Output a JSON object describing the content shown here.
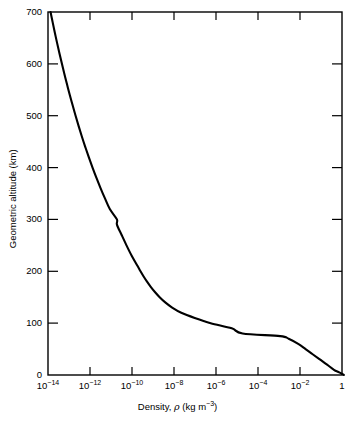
{
  "chart_data": {
    "type": "line",
    "title": "",
    "xlabel": "Density, ρ (kg m⁻³)",
    "ylabel": "Geometric altitude (km)",
    "xscale": "log",
    "yscale": "linear",
    "xlim": [
      1e-14,
      1
    ],
    "ylim": [
      0,
      700
    ],
    "grid": false,
    "legend": null,
    "x_tick_labels": [
      "10⁻¹⁴",
      "10⁻¹²",
      "10⁻¹⁰",
      "10⁻⁸",
      "10⁻⁶",
      "10⁻⁴",
      "10⁻²",
      "1"
    ],
    "x_tick_values": [
      1e-14,
      1e-12,
      1e-10,
      1e-08,
      1e-06,
      0.0001,
      0.01,
      1
    ],
    "y_tick_labels": [
      "0",
      "100",
      "200",
      "300",
      "400",
      "500",
      "600",
      "700"
    ],
    "y_tick_values": [
      0,
      100,
      200,
      300,
      400,
      500,
      600,
      700
    ],
    "series": [
      {
        "name": "Atmospheric density",
        "x_label": "density_kg_m3",
        "y_label": "altitude_km",
        "points": [
          [
            1.225,
            0
          ],
          [
            0.736,
            5
          ],
          [
            0.414,
            10
          ],
          [
            0.195,
            20
          ],
          [
            0.088,
            30
          ],
          [
            0.04,
            40
          ],
          [
            0.01841,
            50
          ],
          [
            0.00821,
            60
          ],
          [
            0.00288,
            70
          ],
          [
            0.001132,
            75
          ],
          [
            1.846e-05,
            80
          ],
          [
            5.6e-06,
            90
          ],
          [
            5.604e-07,
            100
          ],
          [
            9.708e-08,
            110
          ],
          [
            2.222e-08,
            120
          ],
          [
            8.152e-09,
            130
          ],
          [
            3.831e-09,
            140
          ],
          [
            2.076e-09,
            150
          ],
          [
            1.233e-09,
            160
          ],
          [
            7.815e-10,
            170
          ],
          [
            5.194e-10,
            180
          ],
          [
            3.581e-10,
            190
          ],
          [
            2.541e-10,
            200
          ],
          [
            1.846e-10,
            210
          ],
          [
            9.661e-11,
            230
          ],
          [
            5.464e-11,
            250
          ],
          [
            3.215e-11,
            270
          ],
          [
            1.916e-11,
            290
          ],
          [
            1.916e-11,
            300
          ],
          [
            8.77e-12,
            320
          ],
          [
            5.22e-12,
            340
          ],
          [
            3.21e-12,
            360
          ],
          [
            2.03e-12,
            380
          ],
          [
            1.32e-12,
            400
          ],
          [
            8.75e-13,
            420
          ],
          [
            5.93e-13,
            440
          ],
          [
            4.09e-13,
            460
          ],
          [
            2.88e-13,
            480
          ],
          [
            2.06e-13,
            500
          ],
          [
            1.49e-13,
            520
          ],
          [
            1.09e-13,
            540
          ],
          [
            8.09e-14,
            560
          ],
          [
            6.07e-14,
            580
          ],
          [
            4.6e-14,
            600
          ],
          [
            3.52e-14,
            620
          ],
          [
            2.72e-14,
            640
          ],
          [
            2.12e-14,
            660
          ],
          [
            1.67e-14,
            680
          ],
          [
            1.32e-14,
            700
          ]
        ]
      }
    ],
    "annotations": []
  },
  "axes": {
    "x_title": "Density, ",
    "x_title_symbol": "ρ",
    "x_title_units_pre": " (kg m",
    "x_title_units_sup": "−3",
    "x_title_units_post": ")",
    "y_title": "Geometric altitude (km)"
  },
  "x_ticks": [
    {
      "label_base": "10",
      "label_exp": "−14"
    },
    {
      "label_base": "10",
      "label_exp": "−12"
    },
    {
      "label_base": "10",
      "label_exp": "−10"
    },
    {
      "label_base": "10",
      "label_exp": "−8"
    },
    {
      "label_base": "10",
      "label_exp": "−6"
    },
    {
      "label_base": "10",
      "label_exp": "−4"
    },
    {
      "label_base": "10",
      "label_exp": "−2"
    },
    {
      "label_base": "1",
      "label_exp": ""
    }
  ],
  "y_ticks": [
    {
      "label": "700"
    },
    {
      "label": "600"
    },
    {
      "label": "500"
    },
    {
      "label": "400"
    },
    {
      "label": "300"
    },
    {
      "label": "200"
    },
    {
      "label": "100"
    },
    {
      "label": "0"
    }
  ],
  "style": {
    "curve_color": "#000000",
    "frame_color": "#000000",
    "background": "#ffffff"
  }
}
